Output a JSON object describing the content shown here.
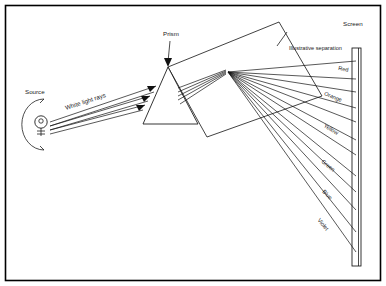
{
  "figure": {
    "background_color": "#ffffff",
    "line_color": "#111111",
    "border_color": "#000000",
    "width": 386,
    "height": 286
  },
  "labels": {
    "source": "Source",
    "white_light_rays": "White light rays",
    "prism": "Prism",
    "illustrative_separation": "Illustrative separation",
    "screen": "Screen"
  },
  "spectrum": {
    "colors": [
      {
        "name": "Red",
        "label_x": 348,
        "label_y": 72,
        "angle": 12
      },
      {
        "name": "Orange",
        "label_x": 341,
        "label_y": 102,
        "angle": 22
      },
      {
        "name": "Yellow",
        "label_x": 337,
        "label_y": 135,
        "angle": 31
      },
      {
        "name": "Green",
        "label_x": 333,
        "label_y": 172,
        "angle": 39
      },
      {
        "name": "Blue",
        "label_x": 330,
        "label_y": 200,
        "angle": 45
      },
      {
        "name": "Violet",
        "label_x": 326,
        "label_y": 231,
        "angle": 51
      }
    ]
  },
  "geometry": {
    "prism": {
      "apex_x": 168,
      "apex_y": 67,
      "base_left_x": 143,
      "base_right_x": 198,
      "base_y": 124
    },
    "dispersion_origin": {
      "x": 228,
      "y": 72
    },
    "screen": {
      "top_y": 48,
      "bottom_y": 266,
      "x": 357
    },
    "source": {
      "x": 39,
      "y": 122
    },
    "incoming_ray_count": 3,
    "dispersed_ray_count": 12
  }
}
